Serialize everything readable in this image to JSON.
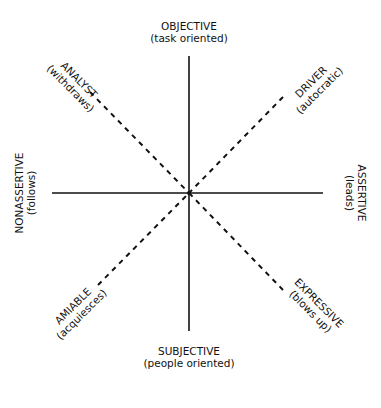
{
  "diagram": {
    "axes": {
      "top": {
        "label": "OBJECTIVE",
        "sublabel": "(task oriented)"
      },
      "bottom": {
        "label": "SUBJECTIVE",
        "sublabel": "(people oriented)"
      },
      "left": {
        "label": "NONASSERTIVE",
        "sublabel": "(follows)"
      },
      "right": {
        "label": "ASSERTIVE",
        "sublabel": "(leads)"
      }
    },
    "diagonals": {
      "upper_left": {
        "label": "ANALYST",
        "sublabel": "(withdraws)"
      },
      "upper_right": {
        "label": "DRIVER",
        "sublabel": "(autocratic)"
      },
      "lower_left": {
        "label": "AMIABLE",
        "sublabel": "(acquiesces)"
      },
      "lower_right": {
        "label": "EXPRESSIVE",
        "sublabel": "(blows up)"
      }
    },
    "colors": {
      "line": "#111111",
      "background": "#ffffff"
    }
  }
}
